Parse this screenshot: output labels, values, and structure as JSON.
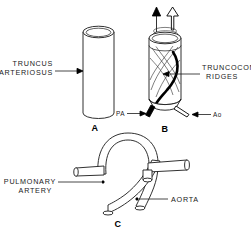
{
  "figure": {
    "background_color": "#ffffff",
    "ink_color": "#1a1a1a",
    "width": 251,
    "height": 235
  },
  "panels": [
    {
      "id": "panel-a",
      "letter": "A",
      "caption": "A"
    },
    {
      "id": "panel-b",
      "letter": "B",
      "caption": "B"
    },
    {
      "id": "panel-c",
      "letter": "C",
      "caption": "C"
    }
  ],
  "labels": {
    "truncus_arteriosus_line1": "TRUNCUS",
    "truncus_arteriosus_line2": "ARTERIOSUS",
    "truncoconal_line1": "TRUNCOCONAL",
    "truncoconal_line2": "RIDGES",
    "pulmonary_artery_line1": "PULMONARY",
    "pulmonary_artery_line2": "ARTERY",
    "aorta": "AORTA",
    "pa_abbrev": "PA",
    "ao_abbrev": "Ao"
  },
  "panel_letters": {
    "a": "A",
    "b": "B",
    "c": "C"
  },
  "flow_arrows": [
    {
      "name": "pulmonary-flow-arrow",
      "style": "solid-black"
    },
    {
      "name": "aortic-flow-arrow",
      "style": "open-white"
    }
  ],
  "vessel_styles": {
    "pulmonary_fill": "#000000",
    "aortic_fill": "#ffffff",
    "outline": "#1a1a1a"
  }
}
